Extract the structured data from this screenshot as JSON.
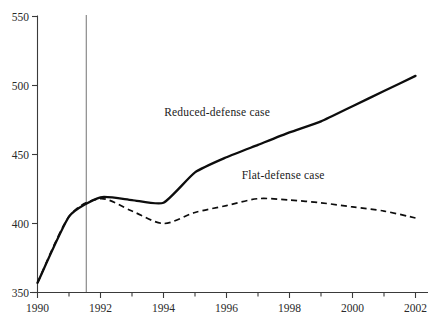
{
  "chart_data": {
    "type": "line",
    "title": "",
    "subtitle": "",
    "xlabel": "",
    "ylabel": "",
    "xlim": [
      1990,
      2002.5
    ],
    "ylim": [
      350,
      550
    ],
    "grid": false,
    "legend_position": "inline-annotation",
    "x": [
      1990,
      1991,
      1992,
      1993,
      1994,
      1995,
      1996,
      1997,
      1998,
      1999,
      2000,
      2001,
      2002
    ],
    "y_ticks": [
      350,
      400,
      450,
      500,
      550
    ],
    "y_tick_labels": [
      "350",
      "400",
      "450",
      "500",
      "550"
    ],
    "x_ticks": [
      1990,
      1991,
      1992,
      1993,
      1994,
      1995,
      1996,
      1997,
      1998,
      1999,
      2000,
      2001,
      2002
    ],
    "x_tick_labels": [
      "1990",
      "",
      "1992",
      "",
      "1994",
      "",
      "1996",
      "",
      "1998",
      "",
      "2000",
      "",
      "2002"
    ],
    "series": [
      {
        "name": "Reduced-defense case",
        "style": "solid",
        "color": "#0d0d0d",
        "label_x": 1995.7,
        "label_y": 478,
        "values": [
          357,
          405,
          419,
          417,
          415,
          437,
          448,
          457,
          466,
          474,
          485,
          496,
          507
        ]
      },
      {
        "name": "Flat-defense case",
        "style": "dashed",
        "color": "#0d0d0d",
        "label_x": 1997.8,
        "label_y": 432,
        "values": [
          357,
          405,
          418,
          409,
          400,
          408,
          413,
          418,
          417,
          415,
          412,
          409,
          404
        ]
      }
    ],
    "annotations": [
      {
        "name": "projection-divider",
        "type": "vertical-line",
        "x": 1991.55,
        "color": "#8a8a8a"
      }
    ]
  },
  "labels": {
    "y_550": "550",
    "y_500": "500",
    "y_450": "450",
    "y_400": "400",
    "y_350": "350",
    "x_1990": "1990",
    "x_1992": "1992",
    "x_1994": "1994",
    "x_1996": "1996",
    "x_1998": "1998",
    "x_2000": "2000",
    "x_2002": "2002",
    "series_reduced": "Reduced-defense case",
    "series_flat": "Flat-defense case"
  }
}
